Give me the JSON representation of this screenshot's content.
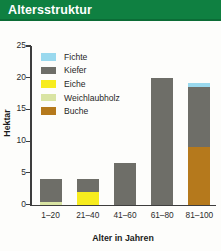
{
  "header": {
    "title": "Altersstruktur",
    "banner_color": "#0f8041"
  },
  "axis": {
    "y_title": "Hektar",
    "x_title": "Alter in Jahren",
    "y_ticks": [
      "0",
      "5",
      "10",
      "15",
      "20",
      "25"
    ]
  },
  "legend": {
    "items": [
      {
        "label": "Fichte",
        "color": "#9ad9ee"
      },
      {
        "label": "Kiefer",
        "color": "#6e6e68"
      },
      {
        "label": "Eiche",
        "color": "#f7ec1e"
      },
      {
        "label": "Weichlaubholz",
        "color": "#d9e4a3"
      },
      {
        "label": "Buche",
        "color": "#b5791c"
      }
    ]
  },
  "chart_data": {
    "type": "bar",
    "stacked": true,
    "title": "Altersstruktur",
    "xlabel": "Alter in Jahren",
    "ylabel": "Hektar",
    "ylim": [
      0,
      25
    ],
    "yticks": [
      0,
      5,
      10,
      15,
      20,
      25
    ],
    "grid": false,
    "legend_position": "inside-top-left",
    "categories": [
      "1–20",
      "21–40",
      "41–60",
      "61–80",
      "81–100"
    ],
    "series": [
      {
        "name": "Weichlaubholz",
        "color": "#d9e4a3",
        "values": [
          0.4,
          0,
          0,
          0,
          0
        ]
      },
      {
        "name": "Eiche",
        "color": "#f7ec1e",
        "values": [
          0,
          2.0,
          0,
          0,
          0
        ]
      },
      {
        "name": "Buche",
        "color": "#b5791c",
        "values": [
          0,
          0,
          0,
          0,
          9.0
        ]
      },
      {
        "name": "Kiefer",
        "color": "#6e6e68",
        "values": [
          3.6,
          2.0,
          6.5,
          20.0,
          9.5
        ]
      },
      {
        "name": "Fichte",
        "color": "#9ad9ee",
        "values": [
          0,
          0,
          0,
          0,
          0.7
        ]
      }
    ],
    "totals": [
      4.0,
      4.0,
      6.5,
      20.0,
      19.2
    ]
  }
}
